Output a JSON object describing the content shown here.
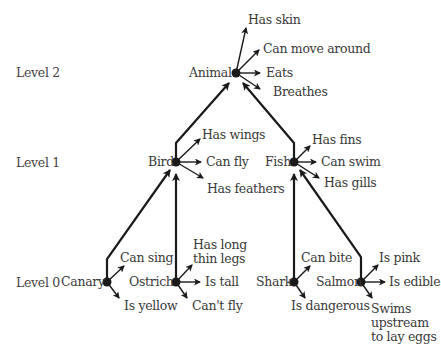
{
  "levels": {
    "level2": "Level 2",
    "level1": "Level 1",
    "level0": "Level 0"
  },
  "nodes": {
    "animal": {
      "name": "Animal",
      "properties": [
        "Has skin",
        "Can move around",
        "Eats",
        "Breathes"
      ]
    },
    "bird": {
      "name": "Bird",
      "properties": [
        "Has wings",
        "Can fly",
        "Has feathers"
      ]
    },
    "fish": {
      "name": "Fish",
      "properties": [
        "Has fins",
        "Can swim",
        "Has gills"
      ]
    },
    "canary": {
      "name": "Canary",
      "properties": [
        "Can sing",
        "Is yellow"
      ]
    },
    "ostrich": {
      "name": "Ostrich",
      "properties": [
        "Has long\nthin legs",
        "Is tall",
        "Can't fly"
      ]
    },
    "shark": {
      "name": "Shark",
      "properties": [
        "Can bite",
        "Is dangerous"
      ]
    },
    "salmon": {
      "name": "Salmon",
      "properties": [
        "Is pink",
        "Is edible",
        "Swims\nupstream\nto lay eggs"
      ]
    }
  },
  "colors": {
    "line": "#1a1a1a",
    "text": "#3a3a3a"
  }
}
